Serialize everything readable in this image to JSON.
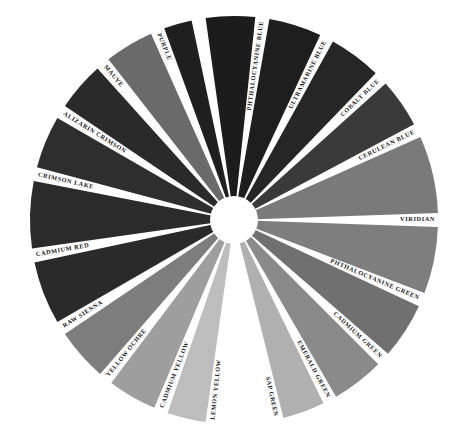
{
  "diagram": {
    "type": "color-wheel",
    "center": [
      234,
      220
    ],
    "outer_radius": 204,
    "inner_radius": 22,
    "wedges": [
      {
        "name": "PHTHALOCYANINE BLUE",
        "start": -8,
        "end": 6,
        "shade": "#1c1c1c"
      },
      {
        "name": "ULTRAMARINE BLUE",
        "start": 10,
        "end": 25,
        "shade": "#1e1e1e"
      },
      {
        "name": "COBALT BLUE",
        "start": 29,
        "end": 44,
        "shade": "#262626"
      },
      {
        "name": "CERULEAN BLUE",
        "start": 48,
        "end": 62,
        "shade": "#3a3a3a"
      },
      {
        "name": "VIRIDIAN",
        "start": 66,
        "end": 88,
        "shade": "#7a7a7a"
      },
      {
        "name": "PHTHALOCYANINE GREEN",
        "start": 92,
        "end": 111,
        "shade": "#7e7e7e"
      },
      {
        "name": "CADMIUM GREEN",
        "start": 115,
        "end": 131,
        "shade": "#707070"
      },
      {
        "name": "EMERALD GREEN",
        "start": 135,
        "end": 150,
        "shade": "#8a8a8a"
      },
      {
        "name": "SAP GREEN",
        "start": 154,
        "end": 166,
        "shade": "#b0b0b0"
      },
      {
        "name": "LEMON YELLOW",
        "start": 188,
        "end": 199,
        "shade": "#bdbdbd"
      },
      {
        "name": "CADMIUM YELLOW",
        "start": 203,
        "end": 217,
        "shade": "#9e9e9e"
      },
      {
        "name": "YELLOW OCHRE",
        "start": 221,
        "end": 236,
        "shade": "#7d7d7d"
      },
      {
        "name": "RAW SIENNA",
        "start": 240,
        "end": 258,
        "shade": "#2a2a2a"
      },
      {
        "name": "CADMIUM RED",
        "start": 262,
        "end": 281,
        "shade": "#2b2b2b"
      },
      {
        "name": "CRIMSON LAKE",
        "start": 285,
        "end": 300,
        "shade": "#2e2e2e"
      },
      {
        "name": "ALIZARIN CRIMSON",
        "start": 304,
        "end": 318,
        "shade": "#2a2a2a"
      },
      {
        "name": "MAUVE",
        "start": 322,
        "end": 336,
        "shade": "#6a6a6a"
      },
      {
        "name": "PURPLE",
        "start": 340,
        "end": 348,
        "shade": "#1f1f1f"
      }
    ],
    "labels": [
      {
        "text": "PHTHALOCYANINE BLUE",
        "angle": 8
      },
      {
        "text": "ULTRAMARINE BLUE",
        "angle": 27
      },
      {
        "text": "COBALT BLUE",
        "angle": 46
      },
      {
        "text": "CERULEAN BLUE",
        "angle": 64
      },
      {
        "text": "VIRIDIAN",
        "angle": 90
      },
      {
        "text": "PHTHALOCYANINE GREEN",
        "angle": 113
      },
      {
        "text": "CADMIUM GREEN",
        "angle": 133
      },
      {
        "text": "EMERALD GREEN",
        "angle": 152
      },
      {
        "text": "SAP GREEN",
        "angle": 168
      },
      {
        "text": "LEMON YELLOW",
        "angle": 186
      },
      {
        "text": "CADMIUM YELLOW",
        "angle": 201
      },
      {
        "text": "YELLOW OCHRE",
        "angle": 219
      },
      {
        "text": "RAW SIENNA",
        "angle": 238
      },
      {
        "text": "CADMIUM RED",
        "angle": 260
      },
      {
        "text": "CRIMSON LAKE",
        "angle": 283
      },
      {
        "text": "ALIZARIN CRIMSON",
        "angle": 302
      },
      {
        "text": "MAUVE",
        "angle": 320
      },
      {
        "text": "PURPLE",
        "angle": 338
      }
    ]
  }
}
